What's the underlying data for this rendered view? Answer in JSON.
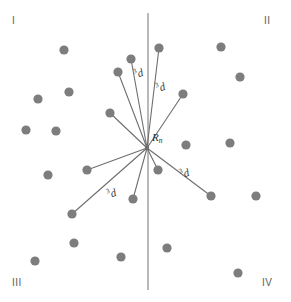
{
  "figure": {
    "background_color": "#ffffff",
    "width": 291,
    "height": 302,
    "dot_color": "#7d7d7d",
    "line_color": "#6e6e6e",
    "axis_color": "#8a8a8a",
    "text_color": "#5a5a5a"
  },
  "axis": {
    "name": "vertical-axis",
    "x": 148,
    "y_top": 13,
    "y_bottom": 290
  },
  "origin": {
    "label_text": "R",
    "label_sub": "n",
    "x": 147,
    "y": 148,
    "label_x": 152,
    "label_y": 132
  },
  "quadrants": [
    {
      "id": "I",
      "label": "I"
    },
    {
      "id": "II",
      "label": "II"
    },
    {
      "id": "III",
      "label": "III"
    },
    {
      "id": "IV",
      "label": "IV"
    }
  ],
  "distance_labels": [
    {
      "id": "d-up-left",
      "sup": "3",
      "base": "d",
      "x": 134,
      "y": 68,
      "rotate": -18
    },
    {
      "id": "d-up-right",
      "sup": "3",
      "base": "d",
      "x": 156,
      "y": 82,
      "rotate": -18
    },
    {
      "id": "d-down-left",
      "sup": "3",
      "base": "d",
      "x": 107,
      "y": 188,
      "rotate": -18
    },
    {
      "id": "d-down-right",
      "sup": "3",
      "base": "d",
      "x": 180,
      "y": 168,
      "rotate": -18
    }
  ],
  "dots": [
    {
      "id": "dot-1",
      "x": 64,
      "y": 50,
      "quadrant": "I",
      "connected": false
    },
    {
      "id": "dot-2",
      "x": 131,
      "y": 59,
      "quadrant": "I",
      "connected": true
    },
    {
      "id": "dot-3",
      "x": 118,
      "y": 72,
      "quadrant": "I",
      "connected": true
    },
    {
      "id": "dot-4",
      "x": 38,
      "y": 99,
      "quadrant": "I",
      "connected": false
    },
    {
      "id": "dot-5",
      "x": 69,
      "y": 92,
      "quadrant": "I",
      "connected": false
    },
    {
      "id": "dot-6",
      "x": 26,
      "y": 130,
      "quadrant": "I",
      "connected": false
    },
    {
      "id": "dot-7",
      "x": 56,
      "y": 131,
      "quadrant": "I",
      "connected": false
    },
    {
      "id": "dot-8",
      "x": 110,
      "y": 113,
      "quadrant": "I",
      "connected": true
    },
    {
      "id": "dot-9",
      "x": 159,
      "y": 48,
      "quadrant": "II",
      "connected": true
    },
    {
      "id": "dot-10",
      "x": 221,
      "y": 47,
      "quadrant": "II",
      "connected": false
    },
    {
      "id": "dot-11",
      "x": 240,
      "y": 77,
      "quadrant": "II",
      "connected": false
    },
    {
      "id": "dot-12",
      "x": 183,
      "y": 94,
      "quadrant": "II",
      "connected": true
    },
    {
      "id": "dot-13",
      "x": 230,
      "y": 143,
      "quadrant": "II",
      "connected": false
    },
    {
      "id": "dot-14",
      "x": 186,
      "y": 145,
      "quadrant": "II",
      "connected": false
    },
    {
      "id": "dot-15",
      "x": 48,
      "y": 175,
      "quadrant": "III",
      "connected": false
    },
    {
      "id": "dot-16",
      "x": 87,
      "y": 170,
      "quadrant": "III",
      "connected": true
    },
    {
      "id": "dot-17",
      "x": 72,
      "y": 214,
      "quadrant": "III",
      "connected": true
    },
    {
      "id": "dot-18",
      "x": 74,
      "y": 243,
      "quadrant": "III",
      "connected": false
    },
    {
      "id": "dot-19",
      "x": 35,
      "y": 261,
      "quadrant": "III",
      "connected": false
    },
    {
      "id": "dot-20",
      "x": 121,
      "y": 257,
      "quadrant": "III",
      "connected": false
    },
    {
      "id": "dot-21",
      "x": 133,
      "y": 199,
      "quadrant": "III",
      "connected": true
    },
    {
      "id": "dot-22",
      "x": 158,
      "y": 170,
      "quadrant": "IV",
      "connected": true
    },
    {
      "id": "dot-23",
      "x": 211,
      "y": 196,
      "quadrant": "IV",
      "connected": true
    },
    {
      "id": "dot-24",
      "x": 256,
      "y": 196,
      "quadrant": "IV",
      "connected": false
    },
    {
      "id": "dot-25",
      "x": 167,
      "y": 248,
      "quadrant": "IV",
      "connected": false
    },
    {
      "id": "dot-26",
      "x": 238,
      "y": 273,
      "quadrant": "IV",
      "connected": false
    }
  ],
  "spokes": [
    {
      "id": "spoke-1",
      "to": "dot-2"
    },
    {
      "id": "spoke-2",
      "to": "dot-3"
    },
    {
      "id": "spoke-3",
      "to": "dot-8"
    },
    {
      "id": "spoke-4",
      "to": "dot-9"
    },
    {
      "id": "spoke-5",
      "to": "dot-12"
    },
    {
      "id": "spoke-6",
      "to": "dot-16"
    },
    {
      "id": "spoke-7",
      "to": "dot-17"
    },
    {
      "id": "spoke-8",
      "to": "dot-21"
    },
    {
      "id": "spoke-9",
      "to": "dot-22"
    },
    {
      "id": "spoke-10",
      "to": "dot-23"
    }
  ]
}
